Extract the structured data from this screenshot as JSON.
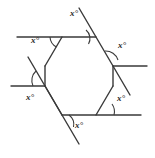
{
  "figure": {
    "stroke_color": "#3a3a3a",
    "label_color": "#2b2b2b",
    "background_color": "#ffffff",
    "stroke_width": 1.4,
    "arc_stroke_width": 1.1,
    "hexagon": {
      "vertices": [
        {
          "name": "top-left",
          "x": 62,
          "y": 37
        },
        {
          "name": "top-right",
          "x": 96,
          "y": 37
        },
        {
          "name": "right",
          "x": 113,
          "y": 66
        },
        {
          "name": "bottom-right",
          "x": 96,
          "y": 115
        },
        {
          "name": "bottom-left",
          "x": 62,
          "y": 115
        },
        {
          "name": "left",
          "x": 45,
          "y": 66
        }
      ]
    },
    "extended_lines": [
      {
        "name": "top-edge-extended-left",
        "x1": 17,
        "y1": 37,
        "x2": 96,
        "y2": 37
      },
      {
        "name": "upper-right-edge-extended-up",
        "x1": 79,
        "y1": 8,
        "x2": 130,
        "y2": 95
      },
      {
        "name": "right-edge-extended-right",
        "x1": 113,
        "y1": 66,
        "x2": 147,
        "y2": 66
      },
      {
        "name": "bottom-edge-extended-right",
        "x1": 62,
        "y1": 115,
        "x2": 141,
        "y2": 115
      },
      {
        "name": "lower-left-edge-extended-down",
        "x1": 79,
        "y1": 144,
        "x2": 28,
        "y2": 57
      },
      {
        "name": "left-edge-extended-left",
        "x1": 45,
        "y1": 86,
        "x2": 11,
        "y2": 86
      }
    ],
    "angle_labels": [
      {
        "name": "angle-top",
        "text": "x°",
        "x": 74,
        "y": 14
      },
      {
        "name": "angle-top-left",
        "text": "x°",
        "x": 35,
        "y": 40
      },
      {
        "name": "angle-right",
        "text": "x°",
        "x": 122,
        "y": 45
      },
      {
        "name": "angle-bottom-right",
        "text": "x°",
        "x": 120,
        "y": 98
      },
      {
        "name": "angle-bottom",
        "text": "x°",
        "x": 78,
        "y": 125
      },
      {
        "name": "angle-left",
        "text": "x°",
        "x": 30,
        "y": 97
      }
    ],
    "angle_value": "x°",
    "angle_count": 6
  }
}
